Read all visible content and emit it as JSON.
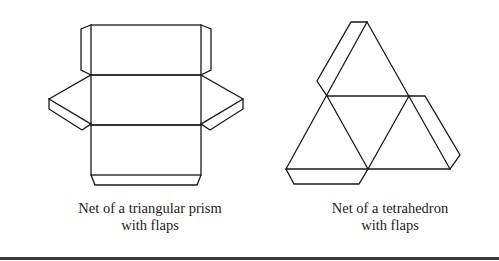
{
  "figures": [
    {
      "id": "triangular-prism",
      "caption_line1": "Net of a triangular prism",
      "caption_line2": "with flaps"
    },
    {
      "id": "tetrahedron",
      "caption_line1": "Net of a tetrahedron",
      "caption_line2": "with flaps"
    }
  ],
  "colors": {
    "stroke": "#1a1a1a",
    "background": "#ffffff",
    "rule": "#3a3a3a"
  }
}
